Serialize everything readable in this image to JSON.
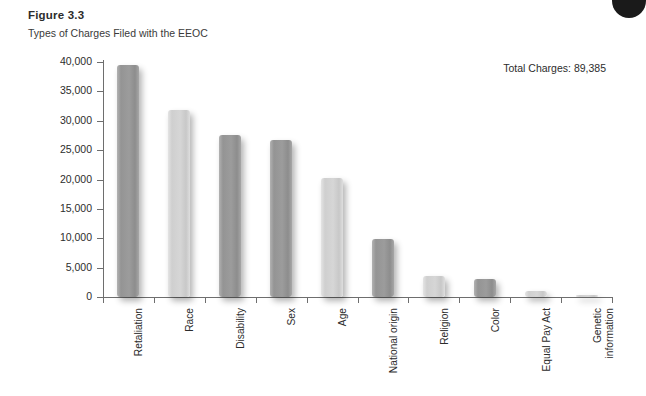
{
  "figure": {
    "title": "Figure 3.3",
    "subtitle": "Types of Charges Filed with the EEOC",
    "total_note": "Total Charges: 89,385"
  },
  "colors": {
    "bar_dark": "#9a9a9a",
    "bar_light": "#d2d2d2",
    "axis": "#6e6e6e",
    "text": "#2c2c2c",
    "background": "#ffffff"
  },
  "chart_data": {
    "type": "bar",
    "title": "Figure 3.3",
    "subtitle": "Types of Charges Filed with the EEOC",
    "xlabel": "",
    "ylabel": "",
    "ylim": [
      0,
      40000
    ],
    "grid": false,
    "legend": null,
    "annotations": [
      "Total Charges: 89,385"
    ],
    "yticks": [
      0,
      5000,
      10000,
      15000,
      20000,
      25000,
      30000,
      35000,
      40000
    ],
    "ytick_labels": [
      "0",
      "5,000",
      "10,000",
      "15,000",
      "20,000",
      "25,000",
      "30,000",
      "35,000",
      "40,000"
    ],
    "categories": [
      "Retaliation",
      "Race",
      "Disability",
      "Sex",
      "Age",
      "National origin",
      "Religion",
      "Color",
      "Equal Pay Act",
      "Genetic\ninformation"
    ],
    "values": [
      39500,
      31800,
      27500,
      26700,
      20300,
      9900,
      3500,
      3000,
      1000,
      200
    ],
    "bar_shades": [
      "dark",
      "light",
      "dark",
      "dark",
      "light",
      "dark",
      "light",
      "dark",
      "light",
      "light"
    ]
  }
}
